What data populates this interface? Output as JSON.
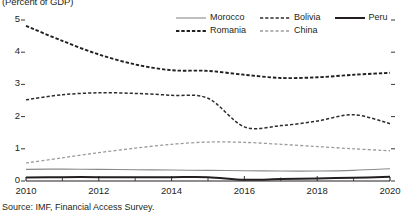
{
  "figure": {
    "unit_title": "(Percent of GDP)",
    "source_note": "Source: IMF, Financial Access Survey."
  },
  "chart_data": {
    "type": "line",
    "title": "",
    "subtitle": "(Percent of GDP)",
    "xlabel": "",
    "ylabel": "",
    "xlim": [
      2010,
      2020
    ],
    "ylim": [
      0,
      5
    ],
    "yticks": [
      "0",
      "1",
      "2",
      "3",
      "4",
      "5"
    ],
    "ytick_values": [
      0,
      1,
      2,
      3,
      4,
      5
    ],
    "xticks": [
      "2010",
      "2012",
      "2014",
      "2016",
      "2018",
      "2020"
    ],
    "xtick_values": [
      2010,
      2012,
      2014,
      2016,
      2018,
      2020
    ],
    "minor_xticks": [
      2011,
      2013,
      2015,
      2017,
      2019
    ],
    "grid": false,
    "legend_position": "top-right",
    "x": [
      2010,
      2011,
      2012,
      2013,
      2014,
      2015,
      2016,
      2017,
      2018,
      2019,
      2020
    ],
    "series": [
      {
        "name": "Morocco",
        "style": "solid-thin",
        "color": "#7f7f7f",
        "values": [
          0.36,
          0.37,
          0.36,
          0.35,
          0.34,
          0.33,
          0.32,
          0.31,
          0.31,
          0.33,
          0.38
        ]
      },
      {
        "name": "Romania",
        "style": "dashed-bold",
        "color": "#231f20",
        "values": [
          4.82,
          4.35,
          3.93,
          3.62,
          3.44,
          3.42,
          3.3,
          3.2,
          3.22,
          3.3,
          3.36
        ]
      },
      {
        "name": "Bolivia",
        "style": "dashed",
        "color": "#231f20",
        "values": [
          2.52,
          2.68,
          2.74,
          2.72,
          2.66,
          2.57,
          1.68,
          1.72,
          1.86,
          2.06,
          1.78
        ]
      },
      {
        "name": "China",
        "style": "dashed-light",
        "color": "#9a9a9a",
        "values": [
          0.56,
          0.72,
          0.88,
          1.02,
          1.14,
          1.21,
          1.2,
          1.14,
          1.07,
          1.0,
          0.94
        ]
      },
      {
        "name": "Peru",
        "style": "solid-bold",
        "color": "#231f20",
        "values": [
          0.11,
          0.12,
          0.12,
          0.12,
          0.12,
          0.12,
          0.04,
          0.06,
          0.08,
          0.1,
          0.13
        ]
      }
    ]
  },
  "legend": {
    "items": [
      {
        "label": "Morocco",
        "style": "solid-thin"
      },
      {
        "label": "Bolivia",
        "style": "dashed"
      },
      {
        "label": "Peru",
        "style": "solid-bold"
      },
      {
        "label": "Romania",
        "style": "dashed-bold"
      },
      {
        "label": "China",
        "style": "dashed-light"
      }
    ]
  }
}
